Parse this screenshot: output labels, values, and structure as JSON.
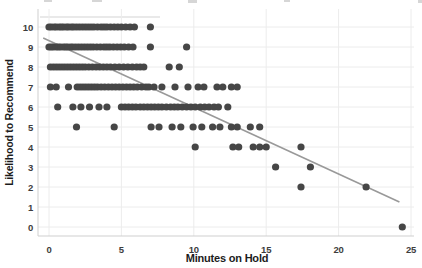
{
  "figure": {
    "background": "#ffffff"
  },
  "chart_data": {
    "type": "scatter",
    "title": "",
    "xlabel": "Minutes on Hold",
    "ylabel": "Likelihood to Recommend",
    "xlim": [
      -0.8,
      25.8
    ],
    "ylim": [
      -0.45,
      10.9
    ],
    "grid": "on",
    "legend": "none",
    "x_ticks": [
      0,
      5,
      10,
      15,
      20,
      25
    ],
    "y_ticks": [
      0,
      1,
      2,
      3,
      4,
      5,
      6,
      7,
      8,
      9,
      10
    ],
    "colors": {
      "point": "#464646",
      "trend": "#999999",
      "grid": "#ececec",
      "axis": "#cfcfcf",
      "tick_text": "#3d3d3d",
      "title_text": "#1c1c1c"
    },
    "points_by_likelihood": [
      {
        "likelihood": 10,
        "minutes": [
          0,
          0.15,
          0.35,
          0.5,
          0.7,
          0.85,
          1.0,
          1.2,
          1.35,
          1.55,
          1.7,
          1.9,
          2.1,
          2.3,
          2.5,
          2.7,
          2.9,
          3.1,
          3.35,
          3.6,
          3.8,
          4.0,
          4.25,
          4.5,
          4.75,
          5.0,
          5.3,
          5.6,
          5.9,
          7.0
        ]
      },
      {
        "likelihood": 9,
        "minutes": [
          0,
          0.15,
          0.3,
          0.5,
          0.65,
          0.8,
          1.0,
          1.15,
          1.3,
          1.5,
          1.65,
          1.85,
          2.05,
          2.25,
          2.45,
          2.65,
          2.85,
          3.05,
          3.3,
          3.55,
          3.8,
          4.0,
          4.2,
          4.45,
          4.7,
          4.95,
          5.2,
          5.5,
          5.8,
          7.0,
          9.5
        ]
      },
      {
        "likelihood": 8,
        "minutes": [
          0.1,
          0.3,
          0.5,
          0.7,
          0.9,
          1.1,
          1.3,
          1.5,
          1.7,
          1.9,
          2.1,
          2.3,
          2.5,
          2.75,
          3.0,
          3.25,
          3.5,
          3.75,
          4.0,
          4.25,
          4.55,
          4.85,
          5.15,
          5.45,
          5.75,
          6.05,
          6.3,
          6.55,
          8.3,
          9.0
        ]
      },
      {
        "likelihood": 7,
        "minutes": [
          0.1,
          0.5,
          1.35,
          1.95,
          2.15,
          2.35,
          2.55,
          2.75,
          2.95,
          3.15,
          3.35,
          3.6,
          3.85,
          4.1,
          4.35,
          4.6,
          4.85,
          5.1,
          5.35,
          5.6,
          5.85,
          6.1,
          6.4,
          6.7,
          6.9,
          7.25,
          7.8,
          8.7,
          9.6,
          10.3,
          10.7,
          11.6,
          12.0,
          12.6,
          13.0
        ]
      },
      {
        "likelihood": 6,
        "minutes": [
          0.6,
          1.65,
          2.2,
          2.8,
          3.45,
          4.0,
          5.0,
          5.25,
          5.5,
          5.75,
          6.0,
          6.3,
          6.55,
          6.8,
          7.05,
          7.3,
          7.55,
          7.8,
          8.1,
          8.4,
          8.65,
          8.9,
          9.2,
          9.5,
          9.8,
          10.1,
          10.45,
          10.75,
          11.05,
          11.4,
          11.7,
          12.35
        ]
      },
      {
        "likelihood": 5,
        "minutes": [
          1.9,
          4.5,
          7.05,
          7.6,
          8.5,
          9.1,
          9.95,
          10.55,
          11.3,
          11.8,
          12.6,
          13.0,
          13.9,
          14.55
        ]
      },
      {
        "likelihood": 4,
        "minutes": [
          10.1,
          12.7,
          13.1,
          14.1,
          14.55,
          15.0,
          17.4
        ]
      },
      {
        "likelihood": 3,
        "minutes": [
          15.65,
          18.05
        ]
      },
      {
        "likelihood": 2,
        "minutes": [
          17.4,
          21.9
        ]
      },
      {
        "likelihood": 0,
        "minutes": [
          24.4
        ]
      }
    ],
    "trendline": {
      "x1": -0.4,
      "y1": 9.45,
      "x2": 24.2,
      "y2": 1.25
    }
  }
}
